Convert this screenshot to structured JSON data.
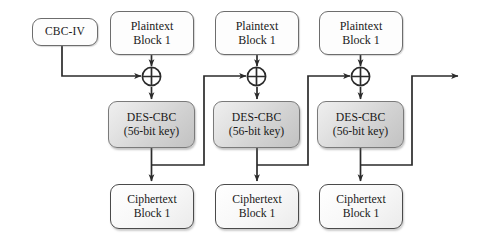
{
  "diagram": {
    "type": "block-flow-diagram",
    "colors": {
      "line": "#2b2b2b",
      "box_border": "#6d6d6d",
      "proc_fill_light": "#efefef",
      "proc_fill_dark": "#c2c2c2",
      "page_background": "#ffffff"
    },
    "iv": {
      "label": "CBC-IV"
    },
    "stages": [
      {
        "plaintext": {
          "line1": "Plaintext",
          "line2": "Block 1"
        },
        "xor": {
          "symbol": "⊕",
          "name": "xor"
        },
        "cipher_engine": {
          "line1": "DES-CBC",
          "line2": "(56-bit key)"
        },
        "ciphertext": {
          "line1": "Ciphertext",
          "line2": "Block 1"
        }
      },
      {
        "plaintext": {
          "line1": "Plaintext",
          "line2": "Block 1"
        },
        "xor": {
          "symbol": "⊕",
          "name": "xor"
        },
        "cipher_engine": {
          "line1": "DES-CBC",
          "line2": "(56-bit key)"
        },
        "ciphertext": {
          "line1": "Ciphertext",
          "line2": "Block 1"
        }
      },
      {
        "plaintext": {
          "line1": "Plaintext",
          "line2": "Block 1"
        },
        "xor": {
          "symbol": "⊕",
          "name": "xor"
        },
        "cipher_engine": {
          "line1": "DES-CBC",
          "line2": "(56-bit key)"
        },
        "ciphertext": {
          "line1": "Ciphertext",
          "line2": "Block 1"
        }
      }
    ]
  }
}
